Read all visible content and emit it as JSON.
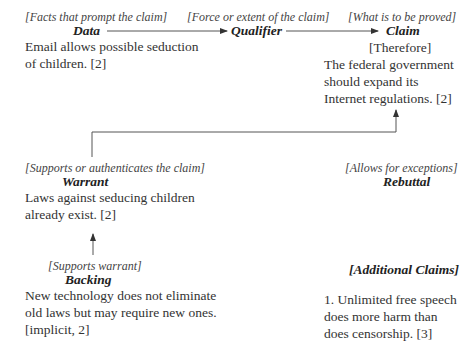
{
  "diagram": {
    "nodes": {
      "data": {
        "caption": "[Facts that prompt the claim]",
        "heading": "Data",
        "text_lines": [
          "Email allows possible seduction",
          "of children. [2]"
        ]
      },
      "qualifier": {
        "caption": "[Force or extent of the claim]",
        "heading": "Qualifier"
      },
      "claim": {
        "caption": "[What is to be proved]",
        "heading": "Claim",
        "subheading": "[Therefore]",
        "text_lines": [
          "The federal government",
          "should expand its",
          "Internet regulations. [2]"
        ]
      },
      "warrant": {
        "caption": "[Supports or authenticates the claim]",
        "heading": "Warrant",
        "text_lines": [
          "Laws against seducing children",
          "already exist. [2]"
        ]
      },
      "rebuttal": {
        "caption": "[Allows for exceptions]",
        "heading": "Rebuttal"
      },
      "backing": {
        "caption": "[Supports warrant]",
        "heading": "Backing",
        "text_lines": [
          "New technology does not eliminate",
          "old laws but may require new ones.",
          "[implicit, 2]"
        ]
      },
      "additional_claims": {
        "heading": "[Additional Claims]",
        "text_lines": [
          "1. Unlimited free speech",
          "does more harm than",
          "does censorship. [3]"
        ]
      }
    },
    "edges": [
      {
        "from": "Data",
        "to": "Qualifier"
      },
      {
        "from": "Qualifier",
        "to": "Claim"
      },
      {
        "from": "Warrant",
        "to": "Claim"
      },
      {
        "from": "Backing",
        "to": "Warrant"
      }
    ],
    "colors": {
      "line": "#555555",
      "text": "#333333"
    }
  }
}
